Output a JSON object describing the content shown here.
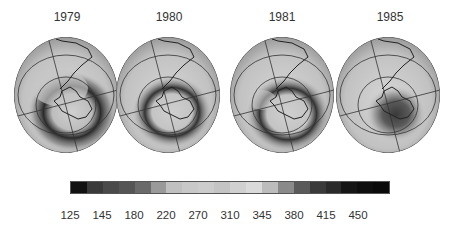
{
  "figure": {
    "panels": [
      {
        "year": "1979",
        "cx": 66,
        "hole": "strong-crescent"
      },
      {
        "year": "1980",
        "cx": 168,
        "hole": "ring"
      },
      {
        "year": "1981",
        "cx": 282,
        "hole": "ring-crescent"
      },
      {
        "year": "1985",
        "cx": 388,
        "hole": "deep-center"
      }
    ]
  },
  "colorbar": {
    "colors": [
      "#111111",
      "#3a3a3a",
      "#4a4a4a",
      "#555555",
      "#6a6a6a",
      "#9a9a9a",
      "#c0c0c0",
      "#c8c8c8",
      "#cccccc",
      "#c4c4c4",
      "#d0d0d0",
      "#dadada",
      "#bcbcbc",
      "#8a8a8a",
      "#5a5a5a",
      "#3a3a3a",
      "#2a2a2a",
      "#151515",
      "#0e0e0e",
      "#0a0a0a"
    ],
    "ticks": [
      "125",
      "145",
      "180",
      "220",
      "270",
      "310",
      "345",
      "380",
      "415",
      "450"
    ]
  },
  "chart_data": {
    "type": "heatmap",
    "title": "",
    "panels": [
      "1979",
      "1980",
      "1981",
      "1985"
    ],
    "colorbar_ticks": [
      125,
      145,
      180,
      220,
      270,
      310,
      345,
      380,
      415,
      450
    ],
    "colorbar_range": [
      125,
      450
    ]
  }
}
